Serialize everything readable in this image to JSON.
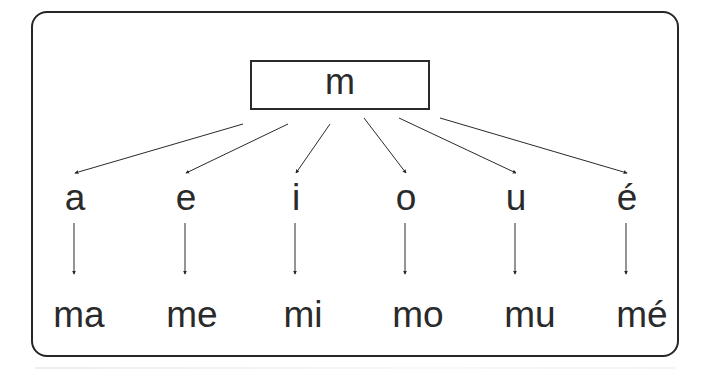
{
  "diagram": {
    "type": "syllable-tree",
    "root": "m",
    "vowels": [
      "a",
      "e",
      "i",
      "o",
      "u",
      "é"
    ],
    "syllables": [
      "ma",
      "me",
      "mi",
      "mo",
      "mu",
      "mé"
    ],
    "colors": {
      "ink": "#2a2a2a",
      "frame": "#262626",
      "background": "#ffffff"
    }
  }
}
